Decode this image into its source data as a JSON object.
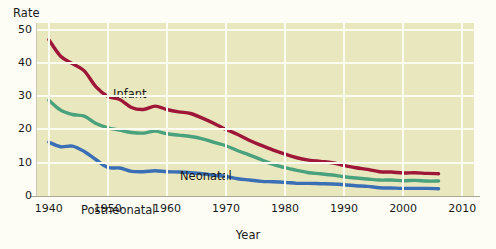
{
  "chart_data": {
    "type": "line",
    "title": "",
    "ylabel": "Rate",
    "xlabel": "Year",
    "xlim": [
      1938,
      2012
    ],
    "ylim": [
      0,
      52
    ],
    "grid": true,
    "legend_position": "inline-labels",
    "x_ticks": [
      "1940",
      "1950",
      "1960",
      "1970",
      "1980",
      "1990",
      "2000",
      "2010"
    ],
    "y_ticks": [
      "0",
      "10",
      "20",
      "30",
      "40",
      "50"
    ],
    "x": [
      1940,
      1942,
      1944,
      1946,
      1948,
      1950,
      1952,
      1954,
      1956,
      1958,
      1960,
      1962,
      1964,
      1966,
      1968,
      1970,
      1972,
      1974,
      1976,
      1978,
      1980,
      1982,
      1984,
      1986,
      1988,
      1990,
      1992,
      1994,
      1996,
      1998,
      2000,
      2002,
      2004,
      2006
    ],
    "series": [
      {
        "name": "Infant",
        "color": "#9e1638",
        "values": [
          47.0,
          42.0,
          39.8,
          37.6,
          32.8,
          29.9,
          29.0,
          26.6,
          26.0,
          27.0,
          26.0,
          25.3,
          24.8,
          23.4,
          21.8,
          20.0,
          18.5,
          16.7,
          15.2,
          13.8,
          12.6,
          11.5,
          10.8,
          10.4,
          10.0,
          9.2,
          8.5,
          8.0,
          7.3,
          7.2,
          6.9,
          7.0,
          6.8,
          6.7
        ]
      },
      {
        "name": "Neonatal",
        "color": "#4aa17d",
        "values": [
          28.8,
          25.8,
          24.5,
          24.0,
          21.8,
          20.5,
          19.8,
          19.1,
          18.9,
          19.5,
          18.7,
          18.3,
          17.9,
          17.2,
          16.1,
          15.1,
          13.6,
          12.3,
          10.9,
          9.5,
          8.5,
          7.7,
          7.0,
          6.7,
          6.3,
          5.8,
          5.4,
          5.1,
          4.8,
          4.8,
          4.6,
          4.7,
          4.5,
          4.5
        ]
      },
      {
        "name": "Postneonatal",
        "color": "#3a6fb5",
        "values": [
          16.2,
          14.8,
          15.0,
          13.4,
          10.9,
          8.6,
          8.4,
          7.4,
          7.3,
          7.6,
          7.3,
          7.2,
          7.0,
          6.7,
          6.2,
          5.9,
          5.2,
          4.8,
          4.4,
          4.3,
          4.1,
          3.8,
          3.8,
          3.7,
          3.6,
          3.4,
          3.1,
          2.9,
          2.5,
          2.4,
          2.3,
          2.3,
          2.3,
          2.2
        ]
      }
    ]
  },
  "labels": {
    "y_axis_title": "Rate",
    "x_axis_title": "Year"
  }
}
